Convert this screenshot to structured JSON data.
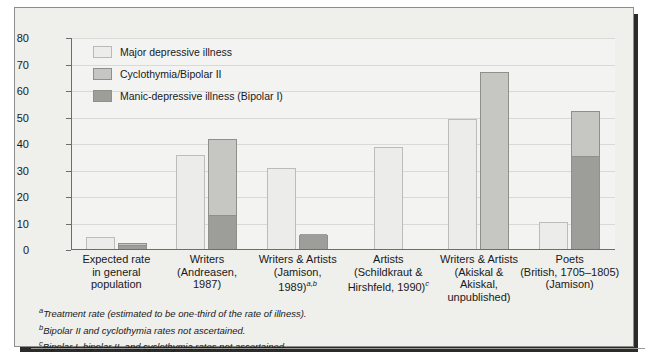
{
  "chart_data": {
    "type": "bar",
    "title": "",
    "subtitle": "",
    "xlabel": "",
    "ylabel": "Percentage",
    "ylim": [
      0,
      80
    ],
    "yticks": [
      0,
      10,
      20,
      30,
      40,
      50,
      60,
      70,
      80
    ],
    "ytick_labels": [
      "0",
      "10",
      "20",
      "30",
      "40",
      "50",
      "60",
      "70",
      "80"
    ],
    "grid": true,
    "legend_position": "upper-left",
    "legend": [
      {
        "label": "Major depressive illness",
        "color": "#ececeb"
      },
      {
        "label": "Cyclothymia/Bipolar II",
        "color": "#c6c6c3"
      },
      {
        "label": "Manic-depressive illness (Bipolar I)",
        "color": "#9d9d9a"
      }
    ],
    "categories": [
      {
        "lines": [
          "Expected rate",
          "in general",
          "population"
        ],
        "marker": ""
      },
      {
        "lines": [
          "Writers",
          "(Andreasen,",
          "1987)"
        ],
        "marker": ""
      },
      {
        "lines": [
          "Writers & Artists",
          "(Jamison,",
          "1989)"
        ],
        "marker": "a,b"
      },
      {
        "lines": [
          "Artists",
          "(Schildkraut &",
          "Hirshfeld, 1990)"
        ],
        "marker": "c"
      },
      {
        "lines": [
          "Writers & Artists",
          "(Akiskal &",
          "Akiskal,",
          "unpublished)"
        ],
        "marker": ""
      },
      {
        "lines": [
          "Poets",
          "(British, 1705–1805)",
          "(Jamison)"
        ],
        "marker": ""
      }
    ],
    "series": [
      {
        "name": "Major depressive illness",
        "color": "#ececeb",
        "values": [
          5,
          36,
          31,
          39,
          49.5,
          10.5
        ]
      },
      {
        "name": "Cyclothymia/Bipolar II",
        "color": "#c6c6c3",
        "values": [
          1,
          29,
          null,
          null,
          67,
          17.5
        ]
      },
      {
        "name": "Manic-depressive illness (Bipolar I)",
        "color": "#9d9d9a",
        "values": [
          1.5,
          13,
          5.5,
          null,
          null,
          35
        ]
      }
    ],
    "stacked_bar_totals": [
      2.5,
      42,
      5.5,
      null,
      67,
      52.5
    ],
    "notes": [
      {
        "marker": "a",
        "text": "Treatment rate (estimated to be one-third of the rate of illness)."
      },
      {
        "marker": "b",
        "text": "Bipolar II and cyclothymia rates not ascertained."
      },
      {
        "marker": "c",
        "text": "Bipolar I, bipolar II, and cyclothymia rates not ascertained."
      }
    ]
  },
  "colors": {
    "panel_background": "#efefec",
    "plot_background": "#f3f3f1",
    "gridline": "#d9d9d6",
    "axis": "#6d6d6a",
    "text": "#19191a",
    "bar_outline": "#8f8f8c",
    "shadow": "#2b2b2b"
  }
}
